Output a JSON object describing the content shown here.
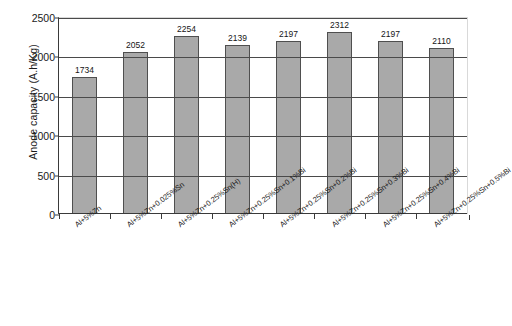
{
  "chart_data": {
    "type": "bar",
    "title": "",
    "xlabel": "",
    "ylabel": "Anode capacity (A.h/Kg)",
    "ylim": [
      0,
      2500
    ],
    "yticks": [
      0,
      500,
      1000,
      1500,
      2000,
      2500
    ],
    "grid": true,
    "legend": false,
    "categories": [
      "Al+5%Zn",
      "Al+5%Zn+0.025%Sn",
      "Al+5%Zn+0.25%Sn(H)",
      "Al+5%Zn+0.25%Sn+0.1%Bi",
      "Al+5%Zn+0.25%Sn+0.2%Bi",
      "Al+5%Zn+0.25%Sn+0.3%Bi",
      "Al+5%Zn+0.25%Sn+0.4%Bi",
      "Al+5%Zn+0.25%Sn+0.5%Bi"
    ],
    "values": [
      1734,
      2052,
      2254,
      2139,
      2197,
      2312,
      2197,
      2110
    ],
    "value_labels": [
      "1734",
      "2052",
      "2254",
      "2139",
      "2197",
      "2312",
      "2197",
      "2110"
    ],
    "bar_color": "#a9a9a9",
    "bar_edge_color": "#4f4f4f",
    "axis_color": "#3a3a3a",
    "gridline_color": "#4a4a4a"
  },
  "ytick_labels": [
    "2500",
    "2000",
    "1500",
    "1000",
    "500",
    "0"
  ]
}
